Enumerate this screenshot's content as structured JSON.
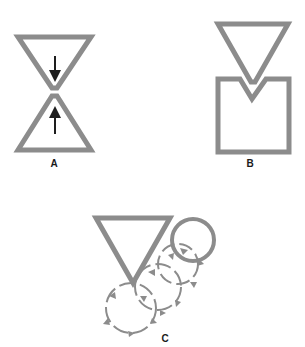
{
  "colors": {
    "stroke": "#8c8c8c",
    "arrow": "#1e1e1e",
    "label": "#1a1a1a",
    "background": "#ffffff"
  },
  "panels": [
    {
      "id": "A",
      "label": "A",
      "description": "Two triangles apex-to-apex with arrows pointing toward the contact point"
    },
    {
      "id": "B",
      "label": "B",
      "description": "Inverted triangle indenting into the top of a square"
    },
    {
      "id": "C",
      "label": "C",
      "description": "Inverted triangle with a circle and rolling circles with curved arrows descending down-left"
    }
  ]
}
